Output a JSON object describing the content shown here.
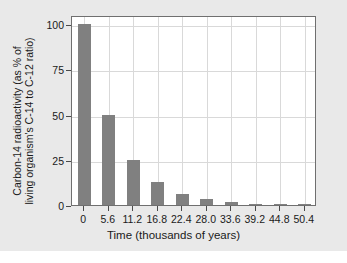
{
  "chart_data": {
    "type": "bar",
    "title": "",
    "xlabel": "Time (thousands of years)",
    "ylabel_line1": "Carbon-14 radioactivity (as % of",
    "ylabel_line2": "living organism's C-14 to C-12 ratio)",
    "ylabel": "Carbon-14 radioactivity (as % of living organism's C-14 to C-12 ratio)",
    "categories": [
      "0",
      "5.6",
      "11.2",
      "16.8",
      "22.4",
      "28.0",
      "33.6",
      "39.2",
      "44.8",
      "50.4"
    ],
    "values": [
      100,
      50,
      25,
      12.5,
      6.25,
      3.13,
      1.56,
      0.78,
      0.39,
      0.2
    ],
    "xtick_labels": [
      "0",
      "5.6",
      "11.2",
      "16.8",
      "22.4",
      "28.0",
      "33.6",
      "39.2",
      "44.8",
      "50.4"
    ],
    "ytick_labels": [
      "0",
      "25",
      "50",
      "75",
      "100"
    ],
    "ytick_values": [
      0,
      25,
      50,
      75,
      100
    ],
    "ylim": [
      0,
      105
    ],
    "grid": true,
    "legend": "none",
    "bar_color": "#808080",
    "grid_color": "#d9d9d9",
    "axis_color": "#6f6f6f",
    "panel_color": "#e9e9e9",
    "plot_color": "#ffffff"
  }
}
